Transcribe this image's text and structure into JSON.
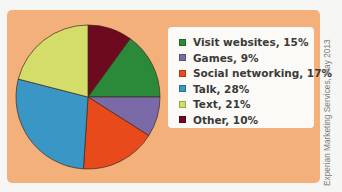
{
  "chart_data": {
    "type": "pie",
    "title": "",
    "categories": [
      "Visit websites",
      "Games",
      "Social networking",
      "Talk",
      "Text",
      "Other"
    ],
    "values": [
      15,
      9,
      17,
      28,
      21,
      10
    ],
    "unit": "%",
    "colors": [
      "#2a8a3a",
      "#7a6aa8",
      "#e84a1c",
      "#3a96c4",
      "#d4dc6a",
      "#6e0a1e"
    ],
    "start_angle_deg": 0,
    "direction": "clockwise",
    "draw_order": [
      "Other",
      "Visit websites",
      "Games",
      "Social networking",
      "Talk",
      "Text"
    ],
    "legend_position": "right",
    "source": "Experian Marketing Services, May 2013"
  },
  "legend": {
    "items": [
      {
        "label": "Visit websites, 15%",
        "color": "#2a8a3a"
      },
      {
        "label": "Games, 9%",
        "color": "#7a6aa8"
      },
      {
        "label": "Social networking, 17%",
        "color": "#e84a1c"
      },
      {
        "label": "Talk, 28%",
        "color": "#3a96c4"
      },
      {
        "label": "Text, 21%",
        "color": "#d4dc6a"
      },
      {
        "label": "Other, 10%",
        "color": "#6e0a1e"
      }
    ]
  },
  "credit": "Experian Marketing Services, May 2013",
  "colors": {
    "panel": "#f3b07a",
    "legend_bg": "#fbfaf6"
  }
}
